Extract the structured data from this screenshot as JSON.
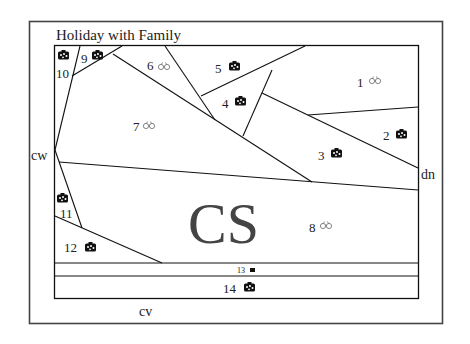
{
  "title": "Holiday with Family",
  "labels": {
    "left": "cw",
    "right": "dn",
    "bottom": "cv",
    "center": "CS"
  },
  "colors": {
    "line": "#111111",
    "outer_line": "#444444",
    "text": "#222222",
    "glasses": "#777777",
    "bag": "#111111",
    "center_text": "#444444"
  },
  "regions": [
    {
      "id": "1",
      "label": "1",
      "icon": "glasses-icon"
    },
    {
      "id": "2",
      "label": "2",
      "icon": "bag-icon"
    },
    {
      "id": "3",
      "label": "3",
      "icon": "bag-icon"
    },
    {
      "id": "4",
      "label": "4",
      "icon": "bag-icon"
    },
    {
      "id": "5",
      "label": "5",
      "icon": "bag-icon"
    },
    {
      "id": "6",
      "label": "6",
      "icon": "glasses-icon"
    },
    {
      "id": "7",
      "label": "7",
      "icon": "glasses-icon"
    },
    {
      "id": "8",
      "label": "8",
      "icon": "glasses-icon"
    },
    {
      "id": "9",
      "label": "9",
      "icon": "bag-icon"
    },
    {
      "id": "10",
      "label": "10",
      "icon": "bag-icon"
    },
    {
      "id": "11",
      "label": "11",
      "icon": "bag-icon"
    },
    {
      "id": "12",
      "label": "12",
      "icon": "bag-icon"
    },
    {
      "id": "13",
      "label": "13",
      "icon": "small-bag-icon"
    },
    {
      "id": "14",
      "label": "14",
      "icon": "bag-icon"
    }
  ]
}
